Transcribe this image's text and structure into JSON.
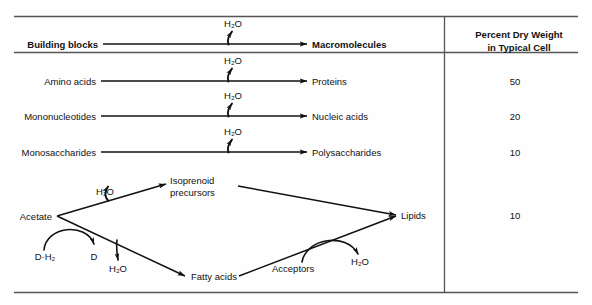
{
  "figure": {
    "type": "diagram",
    "column_header": {
      "line1": "Percent Dry Weight",
      "line2": "in Typical Cell"
    },
    "header_row": {
      "reactant": "Building blocks",
      "product": "Macromolecules",
      "byproduct": "H₂O"
    },
    "rows": [
      {
        "reactant": "Amino acids",
        "product": "Proteins",
        "byproduct": "H₂O",
        "percent": "50"
      },
      {
        "reactant": "Mononucleotides",
        "product": "Nucleic acids",
        "byproduct": "H₂O",
        "percent": "20"
      },
      {
        "reactant": "Monosaccharides",
        "product": "Polysaccharides",
        "byproduct": "H₂O",
        "percent": "10"
      }
    ],
    "lipid_pathway": {
      "source": "Acetate",
      "intermediate_top_line1": "Isoprenoid",
      "intermediate_top_line2": "precursors",
      "intermediate_bottom": "Fatty acids",
      "product": "Lipids",
      "percent": "10",
      "byproduct_top": "H₂O",
      "byproduct_bottom": "H₂O",
      "byproduct_right": "H₂O",
      "reductant": "D·H₂",
      "oxidant": "D",
      "cosubstrate": "Acceptors"
    },
    "colors": {
      "ink": "#111111",
      "rule": "#555555",
      "background": "#fefefe"
    }
  }
}
